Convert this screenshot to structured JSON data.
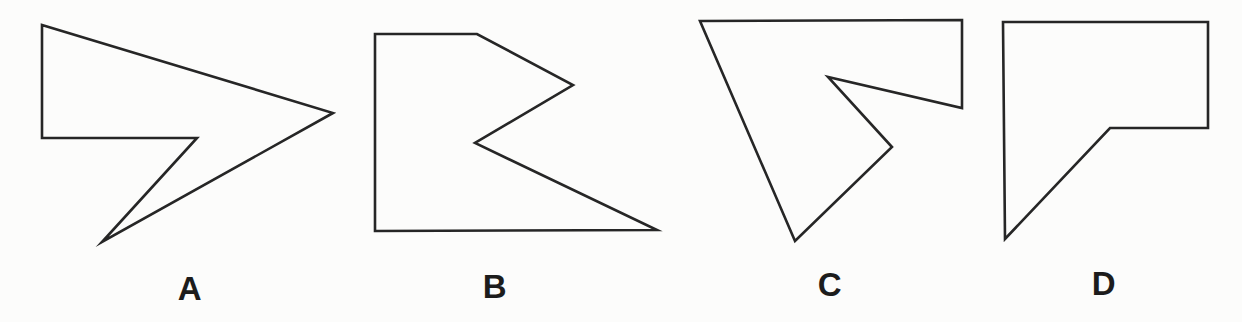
{
  "figure": {
    "background_color": "#fcfcfb",
    "stroke_color": "#262626",
    "label_color": "#1c1c1c"
  },
  "shapes": [
    {
      "label": "A",
      "points": "42,25 333,113 102,242 197,138 42,138"
    },
    {
      "label": "B",
      "points": "375,34 477,34 573,85 475,143 657,230 375,231"
    },
    {
      "label": "C",
      "points": "700,21 962,20 962,108 828,77 892,147 795,241"
    },
    {
      "label": "D",
      "points": "1003,22 1208,22 1208,128 1110,128 1005,239"
    }
  ]
}
